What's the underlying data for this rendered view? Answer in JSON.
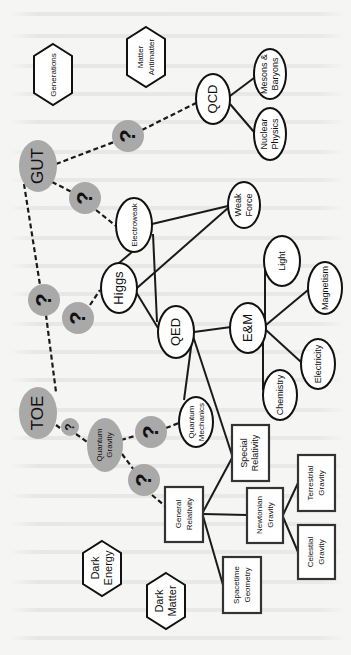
{
  "diagram": {
    "orientation": "rotated-90-ccw",
    "colors": {
      "unknown_fill": "#a9a9a9",
      "node_stroke": "#111111",
      "background": "#f5f5f3"
    },
    "unknown_label": "?",
    "nodes": {
      "toe": "TOE",
      "gut": "GUT",
      "quantum_gravity": [
        "Quantum",
        "Gravity"
      ],
      "electroweak": "Electroweak",
      "qcd": "QCD",
      "mesons_baryons": [
        "Mesons &",
        "Baryons"
      ],
      "nuclear_physics": [
        "Nuclear",
        "Physics"
      ],
      "weak_force": [
        "Weak",
        "Force"
      ],
      "higgs": "Higgs",
      "qed": "QED",
      "em": "E&M",
      "light": "Light",
      "magnetism": "Magnetism",
      "electricity": "Electricity",
      "chemistry": "Chemistry",
      "quantum_mechanics": [
        "Quantum",
        "Mechanics"
      ],
      "special_relativity": [
        "Special",
        "Relativity"
      ],
      "general_relativity": [
        "General",
        "Relativity"
      ],
      "newtonian_gravity": [
        "Newtonian",
        "Gravity"
      ],
      "terrestrial_gravity": [
        "Terrestrial",
        "Gravity"
      ],
      "celestial_gravity": [
        "Celestial",
        "Gravity"
      ],
      "spacetime_geometry": [
        "Spacetime",
        "Geometry"
      ],
      "generations": "Generations",
      "matter_antimatter": [
        "Matter",
        "Antimatter"
      ],
      "dark_energy": [
        "Dark",
        "Energy"
      ],
      "dark_matter": [
        "Dark",
        "Matter"
      ]
    },
    "edges": {
      "dashed": [
        [
          "TOE",
          "?"
        ],
        [
          "?",
          "GUT"
        ],
        [
          "TOE",
          "? (small)"
        ],
        [
          "? (small)",
          "Quantum Gravity"
        ],
        [
          "GUT",
          "?"
        ],
        [
          "?",
          "QCD"
        ],
        [
          "GUT",
          "?"
        ],
        [
          "?",
          "Electroweak"
        ],
        [
          "?",
          "Higgs"
        ],
        [
          "Quantum Gravity",
          "?"
        ],
        [
          "?",
          "Quantum Mechanics"
        ],
        [
          "Quantum Gravity",
          "?"
        ],
        [
          "?",
          "General Relativity"
        ]
      ],
      "solid": [
        [
          "QCD",
          "Mesons & Baryons"
        ],
        [
          "QCD",
          "Nuclear Physics"
        ],
        [
          "Electroweak",
          "Weak Force"
        ],
        [
          "Electroweak",
          "QED"
        ],
        [
          "Electroweak",
          "Higgs"
        ],
        [
          "Higgs",
          "Weak Force"
        ],
        [
          "Higgs",
          "QED"
        ],
        [
          "QED",
          "E&M"
        ],
        [
          "QED",
          "Quantum Mechanics"
        ],
        [
          "QED",
          "Special Relativity"
        ],
        [
          "E&M",
          "Light"
        ],
        [
          "E&M",
          "Magnetism"
        ],
        [
          "E&M",
          "Electricity"
        ],
        [
          "E&M",
          "Chemistry"
        ],
        [
          "General Relativity",
          "Special Relativity"
        ],
        [
          "General Relativity",
          "Newtonian Gravity"
        ],
        [
          "General Relativity",
          "Spacetime Geometry"
        ],
        [
          "Newtonian Gravity",
          "Terrestrial Gravity"
        ],
        [
          "Newtonian Gravity",
          "Celestial Gravity"
        ]
      ]
    }
  }
}
